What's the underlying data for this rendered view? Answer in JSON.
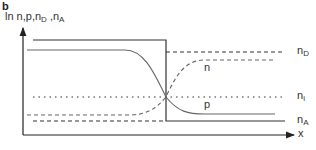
{
  "panel": {
    "label": "b"
  },
  "axes": {
    "y_label_prefix": "ln n,p,n",
    "y_label_sub1": "D",
    "y_label_mid": " ,n",
    "y_label_sub2": "A",
    "x_label": "x"
  },
  "curves": {
    "nD": {
      "base": "n",
      "sub": "D"
    },
    "n": {
      "label": "n"
    },
    "ni": {
      "base": "n",
      "sub": "i"
    },
    "p": {
      "label": "p"
    },
    "nA": {
      "base": "n",
      "sub": "A"
    }
  },
  "colors": {
    "line": "#333333",
    "curve": "#555555"
  }
}
